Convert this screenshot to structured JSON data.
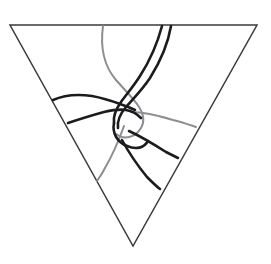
{
  "figure": {
    "type": "line-drawing",
    "width": 271,
    "height": 264,
    "background_color": "#ffffff",
    "caption": ""
  },
  "colors": {
    "outline": "#3a3a3c",
    "strand_dark": "#1c1c1e",
    "strand_gray": "#8e8e92",
    "background": "#ffffff"
  },
  "outline": {
    "name": "inverted-triangle",
    "vertices": [
      {
        "label": "top-left",
        "x": 10,
        "y": 25
      },
      {
        "label": "top-right",
        "x": 257,
        "y": 25
      },
      {
        "label": "bottom",
        "x": 133,
        "y": 246
      }
    ],
    "path": "M 10 25 L 257 25 L 133 246 Z",
    "stroke_width": 1.5
  },
  "strands": [
    {
      "id": "strand-gray-left-descender",
      "label": "gray curve from top edge descending to center",
      "color": "#8e8e92",
      "stroke_width": 2.0,
      "path": "M 103 26 C 100 48, 104 66, 116 80 C 124 89, 131 96, 137 104"
    },
    {
      "id": "strand-gray-loop",
      "label": "gray loop arc around central knot",
      "color": "#8e8e92",
      "stroke_width": 2.0,
      "path": "M 137 104 C 143 112, 145 121, 141 128 C 135 138, 124 140, 116 134"
    },
    {
      "id": "strand-gray-right-branch",
      "label": "gray branch from center to right edge",
      "color": "#8e8e92",
      "stroke_width": 2.0,
      "path": "M 131 112 C 145 112, 160 116, 173 120 C 182 122, 190 125, 196 127"
    },
    {
      "id": "strand-gray-lower-left",
      "label": "gray branch descending to lower left edge",
      "color": "#8e8e92",
      "stroke_width": 2.0,
      "path": "M 124 126 C 119 140, 112 156, 105 168 C 102 174, 99 178, 97 181"
    },
    {
      "id": "strand-dark-outer-right",
      "label": "dark strand from top edge descending left through knot",
      "color": "#1c1c1e",
      "stroke_width": 2.6,
      "path": "M 171 26 C 168 44, 160 62, 150 78 C 142 90, 133 99, 126 107 C 120 114, 117 121, 118 128"
    },
    {
      "id": "strand-dark-inner-right",
      "label": "second dark strand from top edge paralleling the first",
      "color": "#1c1c1e",
      "stroke_width": 2.6,
      "path": "M 162 26 C 157 45, 149 62, 140 76 C 133 87, 126 95, 121 102 C 116 109, 113 116, 114 123"
    },
    {
      "id": "strand-dark-upper-left",
      "label": "dark strand from left edge running right into knot",
      "color": "#1c1c1e",
      "stroke_width": 2.6,
      "path": "M 53 100 C 64 95, 78 94, 92 96 C 103 98, 112 101, 120 104 C 126 106, 131 108, 135 110"
    },
    {
      "id": "strand-dark-lower-left",
      "label": "dark strand from left edge lower, curving right into knot",
      "color": "#1c1c1e",
      "stroke_width": 2.6,
      "path": "M 68 123 C 80 119, 93 115, 104 112 C 113 110, 120 109, 126 110 C 132 111, 137 114, 141 118"
    },
    {
      "id": "strand-dark-knot-loop",
      "label": "dark loop closing the central knot",
      "color": "#1c1c1e",
      "stroke_width": 2.6,
      "path": "M 114 123 C 112 133, 117 142, 127 146 C 136 150, 144 148, 148 141"
    },
    {
      "id": "strand-dark-right-branch",
      "label": "dark branch from knot to right edge",
      "color": "#1c1c1e",
      "stroke_width": 2.6,
      "path": "M 129 131 C 142 137, 155 145, 166 152 C 172 155, 176 157, 178 158"
    },
    {
      "id": "strand-dark-lower-descender",
      "label": "dark strand descending to lower right edge",
      "color": "#1c1c1e",
      "stroke_width": 2.6,
      "path": "M 122 140 C 129 153, 138 166, 147 177 C 153 183, 157 187, 160 189"
    }
  ]
}
